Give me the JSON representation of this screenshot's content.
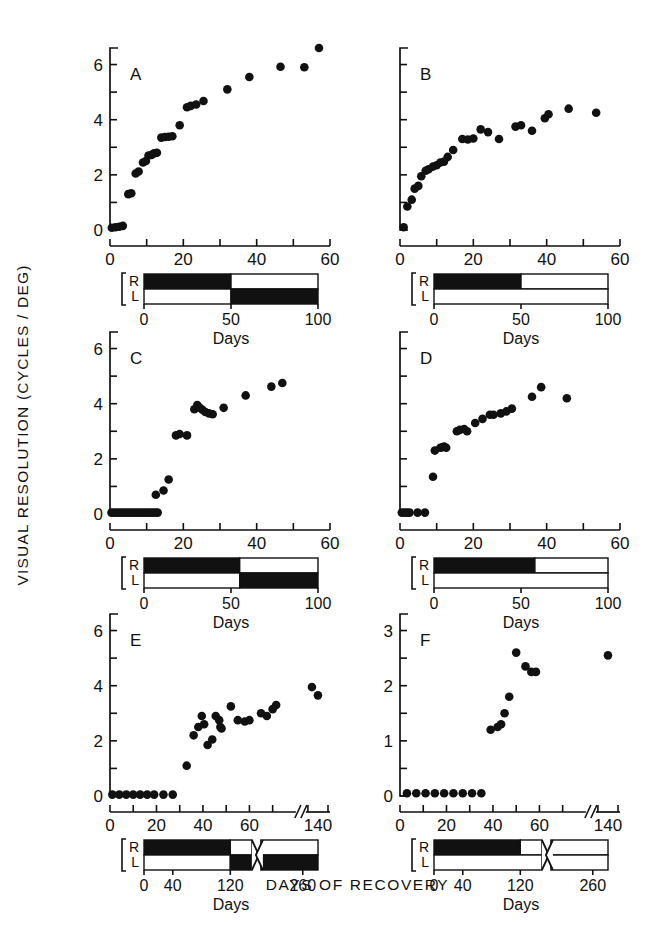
{
  "figure": {
    "y_axis_title": "VISUAL RESOLUTION (CYCLES / DEG)",
    "x_axis_title": "DAYS OF RECOVERY",
    "bar_axis_title": "Days",
    "row_label_right": "R",
    "row_label_left": "L"
  },
  "chart_data": [
    {
      "type": "scatter",
      "panel": "A",
      "title": "A",
      "xlabel": "Days",
      "ylabel": "VISUAL RESOLUTION (CYCLES / DEG)",
      "xlim": [
        0,
        60
      ],
      "ylim": [
        0,
        6.6
      ],
      "xticks": [
        0,
        10,
        20,
        30,
        40,
        50,
        60
      ],
      "xticklabels": [
        "0",
        "",
        "20",
        "",
        "40",
        "",
        "60"
      ],
      "yticks": [
        0,
        1,
        2,
        3,
        4,
        5,
        6
      ],
      "yticklabels": [
        "0",
        "",
        "2",
        "",
        "4",
        "",
        "6"
      ],
      "grid": false,
      "x": [
        0.5,
        1.5,
        2.5,
        3.5,
        5.0,
        5.8,
        7.0,
        7.8,
        9.0,
        9.8,
        10.5,
        11.3,
        12.0,
        12.8,
        14.0,
        15.0,
        16.0,
        17.0,
        19.0,
        21.0,
        22.0,
        23.5,
        25.5,
        32.0,
        38.0,
        46.5,
        53.0,
        57.0
      ],
      "y": [
        0.08,
        0.1,
        0.12,
        0.15,
        1.3,
        1.33,
        2.05,
        2.12,
        2.45,
        2.5,
        2.7,
        2.72,
        2.78,
        2.8,
        3.35,
        3.37,
        3.38,
        3.4,
        3.8,
        4.45,
        4.5,
        4.55,
        4.68,
        5.1,
        5.55,
        5.92,
        5.9,
        6.6
      ],
      "timeline": {
        "axis_max": 100,
        "xticks": [
          0,
          50,
          100
        ],
        "xticklabels": [
          "0",
          "50",
          "100"
        ],
        "rows": [
          {
            "label": "R",
            "segments": [
              {
                "start": 0,
                "end": 50,
                "fill": "black"
              },
              {
                "start": 50,
                "end": 100,
                "fill": "white"
              }
            ]
          },
          {
            "label": "L",
            "segments": [
              {
                "start": 0,
                "end": 50,
                "fill": "white"
              },
              {
                "start": 50,
                "end": 100,
                "fill": "black"
              }
            ]
          }
        ],
        "has_break": false
      }
    },
    {
      "type": "scatter",
      "panel": "B",
      "title": "B",
      "xlabel": "Days",
      "xlim": [
        0,
        60
      ],
      "ylim": [
        0,
        6.6
      ],
      "xticks": [
        0,
        10,
        20,
        30,
        40,
        50,
        60
      ],
      "xticklabels": [
        "0",
        "",
        "20",
        "",
        "40",
        "",
        "60"
      ],
      "yticks": [
        0,
        1,
        2,
        3,
        4,
        5,
        6
      ],
      "yticklabels": [
        "",
        "",
        "",
        "",
        "",
        "",
        ""
      ],
      "grid": false,
      "x": [
        1.0,
        2.0,
        3.2,
        4.0,
        5.0,
        5.8,
        7.0,
        7.8,
        9.0,
        10.0,
        11.0,
        12.0,
        13.0,
        14.5,
        17.0,
        18.5,
        20.0,
        22.0,
        24.0,
        27.0,
        31.5,
        33.0,
        36.0,
        39.5,
        40.5,
        46.0,
        53.5
      ],
      "y": [
        0.1,
        0.85,
        1.1,
        1.5,
        1.6,
        1.95,
        2.15,
        2.2,
        2.3,
        2.35,
        2.45,
        2.48,
        2.65,
        2.9,
        3.3,
        3.28,
        3.32,
        3.65,
        3.55,
        3.3,
        3.75,
        3.8,
        3.6,
        4.05,
        4.2,
        4.4,
        4.25
      ],
      "timeline": {
        "axis_max": 100,
        "xticks": [
          0,
          50,
          100
        ],
        "xticklabels": [
          "0",
          "50",
          "100"
        ],
        "rows": [
          {
            "label": "R",
            "segments": [
              {
                "start": 0,
                "end": 50,
                "fill": "black"
              },
              {
                "start": 50,
                "end": 100,
                "fill": "white"
              }
            ]
          },
          {
            "label": "L",
            "segments": [
              {
                "start": 0,
                "end": 100,
                "fill": "white"
              }
            ]
          }
        ],
        "has_break": false
      }
    },
    {
      "type": "scatter",
      "panel": "C",
      "title": "C",
      "xlabel": "Days",
      "xlim": [
        0,
        60
      ],
      "ylim": [
        0,
        6.6
      ],
      "xticks": [
        0,
        10,
        20,
        30,
        40,
        50,
        60
      ],
      "xticklabels": [
        "0",
        "",
        "20",
        "",
        "40",
        "",
        "60"
      ],
      "yticks": [
        0,
        1,
        2,
        3,
        4,
        5,
        6
      ],
      "yticklabels": [
        "0",
        "",
        "2",
        "",
        "4",
        "",
        "6"
      ],
      "grid": false,
      "x": [
        0.4,
        1.1,
        1.8,
        2.5,
        3.2,
        3.9,
        4.6,
        5.3,
        6.0,
        6.7,
        7.4,
        8.1,
        8.8,
        9.5,
        10.2,
        10.9,
        11.6,
        12.3,
        13.0,
        12.5,
        14.6,
        16.0,
        18.0,
        19.0,
        21.0,
        23.0,
        23.8,
        24.5,
        25.2,
        26.0,
        27.0,
        28.0,
        31.0,
        37.0,
        44.0,
        47.0
      ],
      "y": [
        0.05,
        0.05,
        0.05,
        0.05,
        0.05,
        0.05,
        0.05,
        0.05,
        0.05,
        0.05,
        0.05,
        0.05,
        0.05,
        0.05,
        0.05,
        0.05,
        0.05,
        0.05,
        0.05,
        0.7,
        0.85,
        1.25,
        2.85,
        2.9,
        2.85,
        3.8,
        3.95,
        3.85,
        3.78,
        3.7,
        3.65,
        3.62,
        3.85,
        4.3,
        4.62,
        4.75
      ],
      "timeline": {
        "axis_max": 100,
        "xticks": [
          0,
          50,
          100
        ],
        "xticklabels": [
          "0",
          "50",
          "100"
        ],
        "rows": [
          {
            "label": "R",
            "segments": [
              {
                "start": 0,
                "end": 55,
                "fill": "black"
              },
              {
                "start": 55,
                "end": 100,
                "fill": "white"
              }
            ]
          },
          {
            "label": "L",
            "segments": [
              {
                "start": 0,
                "end": 55,
                "fill": "white"
              },
              {
                "start": 55,
                "end": 100,
                "fill": "black"
              }
            ]
          }
        ],
        "has_break": false
      }
    },
    {
      "type": "scatter",
      "panel": "D",
      "title": "D",
      "xlabel": "Days",
      "xlim": [
        0,
        60
      ],
      "ylim": [
        0,
        6.6
      ],
      "xticks": [
        0,
        10,
        20,
        30,
        40,
        50,
        60
      ],
      "xticklabels": [
        "0",
        "",
        "20",
        "",
        "40",
        "",
        "60"
      ],
      "yticks": [
        0,
        1,
        2,
        3,
        4,
        5,
        6
      ],
      "yticklabels": [
        "",
        "",
        "",
        "",
        "",
        "",
        ""
      ],
      "grid": false,
      "x": [
        0.5,
        1.2,
        1.9,
        2.6,
        4.8,
        6.8,
        9.0,
        9.5,
        11.0,
        11.5,
        12.0,
        12.6,
        15.5,
        16.3,
        17.5,
        18.3,
        20.5,
        22.5,
        24.5,
        25.5,
        27.5,
        29.0,
        30.5,
        36.0,
        38.5,
        45.5
      ],
      "y": [
        0.05,
        0.05,
        0.05,
        0.05,
        0.05,
        0.05,
        1.35,
        2.3,
        2.4,
        2.42,
        2.45,
        2.4,
        3.0,
        3.05,
        3.08,
        3.0,
        3.3,
        3.45,
        3.6,
        3.6,
        3.65,
        3.72,
        3.82,
        4.25,
        4.6,
        4.2
      ],
      "timeline": {
        "axis_max": 100,
        "xticks": [
          0,
          50,
          100
        ],
        "xticklabels": [
          "0",
          "50",
          "100"
        ],
        "rows": [
          {
            "label": "R",
            "segments": [
              {
                "start": 0,
                "end": 58,
                "fill": "black"
              },
              {
                "start": 58,
                "end": 100,
                "fill": "white"
              }
            ]
          },
          {
            "label": "L",
            "segments": [
              {
                "start": 0,
                "end": 100,
                "fill": "white"
              }
            ]
          }
        ],
        "has_break": false
      }
    },
    {
      "type": "scatter",
      "panel": "E",
      "title": "E",
      "xlabel": "Days",
      "xlim": [
        0,
        80
      ],
      "ylim": [
        0,
        6.6
      ],
      "xticks": [
        0,
        10,
        20,
        30,
        40,
        50,
        60,
        70
      ],
      "xticklabels": [
        "0",
        "",
        "20",
        "",
        "40",
        "",
        "60",
        ""
      ],
      "yticks": [
        0,
        1,
        2,
        3,
        4,
        5,
        6
      ],
      "yticklabels": [
        "0",
        "",
        "2",
        "",
        "4",
        "",
        "6"
      ],
      "axis_break": {
        "at": 72,
        "resume_label": "140"
      },
      "grid": false,
      "x": [
        1.0,
        4.0,
        7.0,
        10.0,
        13.0,
        16.0,
        19.0,
        23.0,
        27.0,
        33.0,
        36.0,
        38.0,
        39.5,
        40.5,
        42.0,
        44.0,
        45.5,
        47.0,
        47.5,
        48.0,
        52.0,
        55.0,
        58.0,
        60.0,
        65.0,
        67.5,
        70.0,
        71.5,
        86.0,
        88.0
      ],
      "y": [
        0.05,
        0.05,
        0.05,
        0.05,
        0.05,
        0.05,
        0.05,
        0.05,
        0.05,
        1.1,
        2.2,
        2.5,
        2.9,
        2.6,
        1.85,
        2.05,
        2.9,
        2.75,
        2.5,
        2.45,
        3.25,
        2.75,
        2.7,
        2.75,
        3.0,
        2.9,
        3.15,
        3.3,
        3.95,
        3.65
      ],
      "timeline": {
        "axis_max": 300,
        "xticks": [
          0,
          40,
          120,
          260
        ],
        "xticklabels": [
          "0",
          "40",
          "120",
          "260"
        ],
        "rows": [
          {
            "label": "R",
            "segments": [
              {
                "start": 0,
                "end": 120,
                "fill": "black"
              },
              {
                "start": 120,
                "end": 300,
                "fill": "white"
              }
            ]
          },
          {
            "label": "L",
            "segments": [
              {
                "start": 0,
                "end": 120,
                "fill": "white"
              },
              {
                "start": 120,
                "end": 300,
                "fill": "black"
              }
            ]
          }
        ],
        "has_break": true,
        "break_at": 150
      }
    },
    {
      "type": "scatter",
      "panel": "F",
      "title": "F",
      "xlabel": "Days",
      "xlim": [
        0,
        80
      ],
      "ylim": [
        0,
        3.3
      ],
      "xticks": [
        0,
        10,
        20,
        30,
        40,
        50,
        60,
        70
      ],
      "xticklabels": [
        "0",
        "",
        "20",
        "",
        "40",
        "",
        "60",
        ""
      ],
      "yticks": [
        0,
        0.5,
        1,
        1.5,
        2,
        2.5,
        3
      ],
      "yticklabels": [
        "0",
        "",
        "1",
        "",
        "2",
        "",
        "3"
      ],
      "axis_break": {
        "at": 72,
        "resume_label": "140"
      },
      "grid": false,
      "x": [
        3.0,
        7.0,
        11.0,
        15.0,
        19.0,
        23.0,
        27.0,
        31.0,
        35.0,
        39.0,
        42.0,
        43.5,
        45.0,
        47.0,
        50.0,
        54.0,
        56.5,
        58.5,
        88.0
      ],
      "y": [
        0.05,
        0.05,
        0.05,
        0.05,
        0.05,
        0.05,
        0.05,
        0.05,
        0.05,
        1.2,
        1.25,
        1.3,
        1.5,
        1.8,
        2.6,
        2.35,
        2.25,
        2.25,
        2.55
      ],
      "timeline": {
        "axis_max": 300,
        "xticks": [
          0,
          40,
          120,
          260
        ],
        "xticklabels": [
          "0",
          "40",
          "120",
          "260"
        ],
        "rows": [
          {
            "label": "R",
            "segments": [
              {
                "start": 0,
                "end": 120,
                "fill": "black"
              },
              {
                "start": 120,
                "end": 300,
                "fill": "white"
              }
            ]
          },
          {
            "label": "L",
            "segments": [
              {
                "start": 0,
                "end": 300,
                "fill": "white"
              }
            ]
          }
        ],
        "has_break": true,
        "break_at": 150
      }
    }
  ]
}
